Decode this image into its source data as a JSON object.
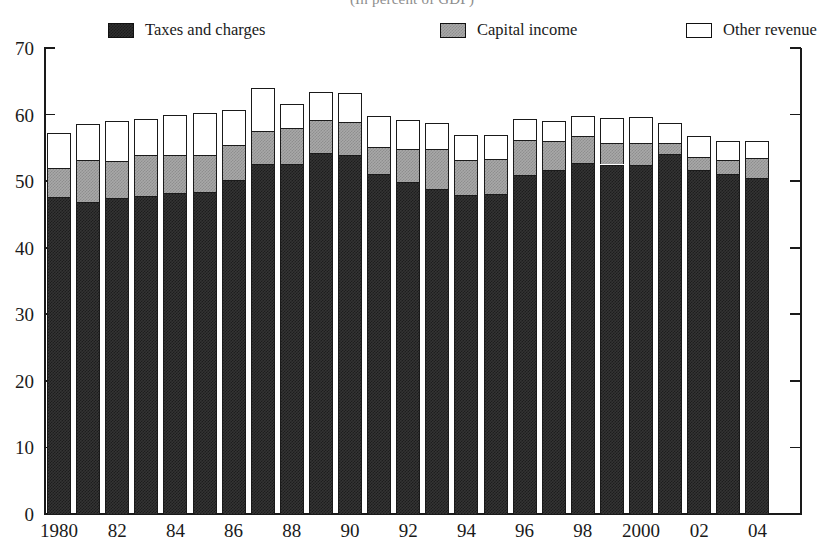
{
  "figure": {
    "suptitle": "(In percent of GDP)"
  },
  "legend": [
    {
      "label": "Taxes and charges",
      "swatch": "dark-hatch-swatch",
      "color": "#2f2f2f"
    },
    {
      "label": "Capital income",
      "swatch": "gray-hatch-swatch",
      "color": "#a9a9a9"
    },
    {
      "label": "Other revenue",
      "swatch": "white-swatch",
      "color": "#ffffff"
    }
  ],
  "chart_data": {
    "type": "bar",
    "stacked": true,
    "title": "(In percent of GDP)",
    "xlabel": "",
    "ylabel": "",
    "ylim": [
      0,
      70
    ],
    "yticks": [
      0,
      10,
      20,
      30,
      40,
      50,
      60,
      70
    ],
    "ytick_labels": [
      "0",
      "10",
      "20",
      "30",
      "40",
      "50",
      "60",
      "70"
    ],
    "grid": false,
    "legend_position": "top",
    "categories": [
      "1980",
      "1981",
      "1982",
      "1983",
      "1984",
      "1985",
      "1986",
      "1987",
      "1988",
      "1989",
      "1990",
      "1991",
      "1992",
      "1993",
      "1994",
      "1995",
      "1996",
      "1997",
      "1998",
      "1999",
      "2000",
      "2001",
      "2002",
      "2003",
      "2004"
    ],
    "xtick_labels": [
      "1980",
      "",
      "82",
      "",
      "84",
      "",
      "86",
      "",
      "88",
      "",
      "90",
      "",
      "92",
      "",
      "94",
      "",
      "96",
      "",
      "98",
      "",
      "2000",
      "",
      "02",
      "",
      "04"
    ],
    "series": [
      {
        "name": "Taxes and charges",
        "color": "#2f2f2f",
        "values": [
          47.6,
          46.9,
          47.5,
          47.8,
          48.2,
          48.4,
          50.2,
          52.6,
          52.6,
          54.2,
          54.0,
          51.1,
          49.8,
          48.8,
          47.9,
          48.0,
          50.9,
          51.6,
          52.7,
          52.5,
          52.4,
          54.1,
          51.6,
          51.1,
          50.4
        ]
      },
      {
        "name": "Capital income",
        "color": "#a9a9a9",
        "values": [
          4.4,
          6.3,
          5.5,
          6.2,
          5.8,
          5.5,
          5.2,
          5.0,
          5.4,
          5.0,
          4.9,
          4.0,
          5.1,
          6.0,
          5.3,
          5.4,
          5.3,
          4.5,
          4.1,
          3.2,
          3.4,
          1.6,
          2.0,
          2.1,
          3.1
        ]
      },
      {
        "name": "Other revenue",
        "color": "#ffffff",
        "values": [
          5.2,
          5.4,
          6.0,
          5.3,
          6.0,
          6.4,
          5.3,
          6.4,
          3.6,
          4.2,
          4.4,
          4.7,
          4.3,
          3.9,
          3.8,
          3.5,
          3.2,
          3.0,
          3.0,
          3.8,
          3.8,
          3.1,
          3.2,
          2.8,
          2.5
        ]
      }
    ],
    "totals": [
      57.2,
      58.6,
      59.0,
      59.3,
      60.0,
      60.3,
      60.7,
      64.0,
      61.6,
      63.4,
      63.3,
      59.8,
      59.2,
      58.7,
      57.0,
      56.9,
      59.4,
      59.1,
      59.8,
      59.5,
      59.6,
      58.8,
      56.8,
      56.0,
      56.0
    ],
    "axis_geometry": {
      "plot_left": 44,
      "plot_right": 801,
      "baseline_y": 514,
      "top_y": 48,
      "bar_width": 24,
      "bar_pitch": 29.1
    }
  }
}
